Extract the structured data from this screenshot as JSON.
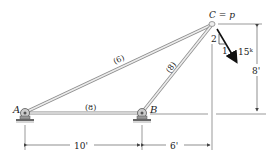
{
  "diagram": {
    "type": "truss",
    "joints": {
      "A": {
        "label": "A",
        "support": "pin"
      },
      "B": {
        "label": "B",
        "support": "pin"
      },
      "C": {
        "label": "C = p"
      }
    },
    "members": [
      {
        "id": "AC",
        "label": "(6)"
      },
      {
        "id": "BC",
        "label": "(8)"
      },
      {
        "id": "AB",
        "label": "(8)"
      }
    ],
    "load": {
      "magnitude": "15ᵏ",
      "slope_rise": "2",
      "slope_run": "1"
    },
    "dimensions": {
      "AB_horizontal": "10'",
      "B_to_C_horizontal": "6'",
      "C_height": "8'"
    },
    "colors": {
      "member_fill": "#e8e8e8",
      "member_edge": "#8a8a8a",
      "line": "#555555",
      "text": "#222222"
    }
  }
}
